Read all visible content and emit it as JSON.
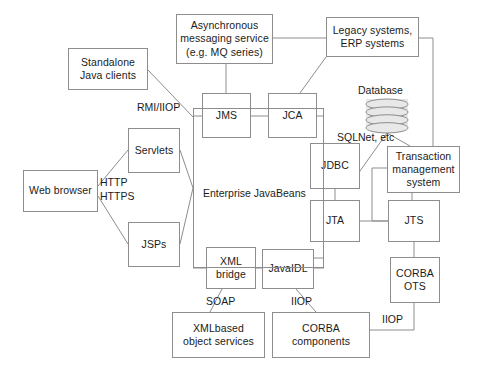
{
  "diagram": {
    "style": {
      "stroke": "#8d8d8d",
      "text": "#1b1b1b",
      "background": "#ffffff",
      "db_fill": "#e8e8e8"
    },
    "nodes": [
      {
        "id": "standalone-java-clients",
        "lines": [
          "Standalone",
          "Java clients"
        ],
        "x": 68,
        "y": 48,
        "w": 80,
        "h": 42
      },
      {
        "id": "async-messaging-service",
        "lines": [
          "Asynchronous",
          "messaging service",
          "(e.g. MQ series)"
        ],
        "x": 176,
        "y": 14,
        "w": 97,
        "h": 50
      },
      {
        "id": "legacy-erp-systems",
        "lines": [
          "Legacy systems,",
          "ERP systems"
        ],
        "x": 326,
        "y": 17,
        "w": 93,
        "h": 40
      },
      {
        "id": "jms",
        "lines": [
          "JMS"
        ],
        "x": 202,
        "y": 93,
        "w": 49,
        "h": 45
      },
      {
        "id": "jca",
        "lines": [
          "JCA"
        ],
        "x": 268,
        "y": 93,
        "w": 49,
        "h": 45
      },
      {
        "id": "servlets",
        "lines": [
          "Servlets"
        ],
        "x": 128,
        "y": 128,
        "w": 52,
        "h": 45
      },
      {
        "id": "web-browser",
        "lines": [
          "Web browser"
        ],
        "x": 23,
        "y": 170,
        "w": 75,
        "h": 42
      },
      {
        "id": "jsps",
        "lines": [
          "JSPs"
        ],
        "x": 128,
        "y": 222,
        "w": 52,
        "h": 45
      },
      {
        "id": "jdbc",
        "lines": [
          "JDBC"
        ],
        "x": 310,
        "y": 143,
        "w": 50,
        "h": 46
      },
      {
        "id": "transaction-management-system",
        "lines": [
          "Transaction",
          "management",
          "system"
        ],
        "x": 387,
        "y": 146,
        "w": 73,
        "h": 47
      },
      {
        "id": "jta",
        "lines": [
          "JTA"
        ],
        "x": 310,
        "y": 200,
        "w": 50,
        "h": 42
      },
      {
        "id": "jts",
        "lines": [
          "JTS"
        ],
        "x": 388,
        "y": 200,
        "w": 52,
        "h": 42
      },
      {
        "id": "xml-bridge",
        "lines": [
          "XML",
          "bridge"
        ],
        "x": 206,
        "y": 247,
        "w": 50,
        "h": 42
      },
      {
        "id": "javaidl",
        "lines": [
          "JavaIDL"
        ],
        "x": 262,
        "y": 249,
        "w": 52,
        "h": 40
      },
      {
        "id": "corba-ots",
        "lines": [
          "CORBA",
          "OTS"
        ],
        "x": 390,
        "y": 257,
        "w": 50,
        "h": 46
      },
      {
        "id": "xmlbased-object-services",
        "lines": [
          "XMLbased",
          "object services"
        ],
        "x": 172,
        "y": 312,
        "w": 93,
        "h": 46
      },
      {
        "id": "corba-components",
        "lines": [
          "CORBA components"
        ],
        "x": 272,
        "y": 312,
        "w": 98,
        "h": 46
      }
    ],
    "container": {
      "id": "enterprise-javabeans",
      "label": "Enterprise JavaBeans",
      "x": 193,
      "y": 108,
      "w": 131,
      "h": 160,
      "label_x": 203,
      "label_y": 187
    },
    "database": {
      "id": "database",
      "caption": "Database",
      "caption_x": 358,
      "caption_y": 84,
      "x": 366,
      "y": 99,
      "w": 42,
      "h": 34
    },
    "edge_labels": [
      {
        "id": "rmi-iiop",
        "text": "RMI/IIOP",
        "x": 137,
        "y": 101
      },
      {
        "id": "http",
        "text": "HTTP",
        "x": 100,
        "y": 176
      },
      {
        "id": "https",
        "text": "HTTPS",
        "x": 100,
        "y": 190
      },
      {
        "id": "sqlnet-etc",
        "text": "SQLNet, etc",
        "x": 337,
        "y": 131
      },
      {
        "id": "soap",
        "text": "SOAP",
        "x": 206,
        "y": 295
      },
      {
        "id": "iiop-javaidl",
        "text": "IIOP",
        "x": 291,
        "y": 295
      },
      {
        "id": "iiop-corba-ots",
        "text": "IIOP",
        "x": 382,
        "y": 313
      }
    ],
    "connectors": [
      {
        "id": "standalone-to-ejb",
        "path": "M148,70 L193,117"
      },
      {
        "id": "async-to-legacy",
        "path": "M273,38 L326,38"
      },
      {
        "id": "async-to-jms",
        "path": "M226,64 L226,93"
      },
      {
        "id": "legacy-to-jca",
        "path": "M326,57 L300,93"
      },
      {
        "id": "legacy-to-right-bus",
        "path": "M419,38 L433,38 L433,146"
      },
      {
        "id": "jms-to-jca",
        "path": "M251,116 L268,116"
      },
      {
        "id": "jms-to-ejb",
        "path": "M202,116 L193,116"
      },
      {
        "id": "jca-to-ejb-right",
        "path": "M317,116 L324,116"
      },
      {
        "id": "browser-to-servlets",
        "path": "M98,186 L128,150"
      },
      {
        "id": "browser-to-jsps",
        "path": "M98,196 L128,244"
      },
      {
        "id": "servlets-to-ejb",
        "path": "M180,150 L193,188"
      },
      {
        "id": "jsps-to-ejb",
        "path": "M180,244 L193,188"
      },
      {
        "id": "db-to-jdbc",
        "path": "M387,133 L355,178"
      },
      {
        "id": "db-to-tms",
        "path": "M387,133 L410,146"
      },
      {
        "id": "jdbc-to-ejb",
        "path": "M310,166 L324,166"
      },
      {
        "id": "jdbc-to-jta",
        "path": "M335,189 L335,200"
      },
      {
        "id": "jta-to-ejb",
        "path": "M310,221 L324,221"
      },
      {
        "id": "tms-to-jts",
        "path": "M412,193 L412,200"
      },
      {
        "id": "tms-left-bus",
        "path": "M387,168 L372,168 L372,221 L388,221"
      },
      {
        "id": "jta-to-jts",
        "path": "M360,221 L388,221"
      },
      {
        "id": "jts-to-corba-ots",
        "path": "M414,242 L414,257"
      },
      {
        "id": "ejb-to-xml-bridge",
        "path": "M193,268 L206,268"
      },
      {
        "id": "xml-to-javaidl",
        "path": "M256,268 L262,268"
      },
      {
        "id": "javaidl-to-ejb",
        "path": "M314,268 L324,268"
      },
      {
        "id": "javaidl-to-jta-up",
        "path": "M314,258 L324,258"
      },
      {
        "id": "xml-to-xmlbased",
        "path": "M222,289 L210,312"
      },
      {
        "id": "javaidl-to-corba",
        "path": "M296,289 L316,312"
      },
      {
        "id": "corba-ots-to-corba-components",
        "path": "M414,303 L414,330 L370,330"
      }
    ]
  }
}
